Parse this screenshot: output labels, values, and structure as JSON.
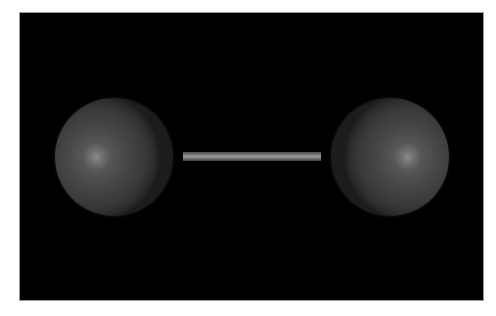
{
  "scene": {
    "description": "3D render of a diatomic molecule: two grey spheres joined by a single cylindrical bond on a black background",
    "background_color": "#000000",
    "atoms": [
      {
        "id": "left",
        "color": "#4a4a4a",
        "highlight": "#8a8a8a"
      },
      {
        "id": "right",
        "color": "#4a4a4a",
        "highlight": "#8a8a8a"
      }
    ],
    "bond": {
      "color": "#8a8a8a",
      "order": 1
    }
  }
}
